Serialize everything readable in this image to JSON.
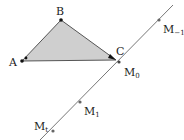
{
  "diagram": {
    "colors": {
      "triangle_fill": "#cfcfcf",
      "stroke": "#555555",
      "line": "#777777",
      "point": "#111111",
      "text": "#222222"
    },
    "triangle": {
      "vertices": [
        {
          "name": "A",
          "label": "A",
          "x": 22,
          "y": 61
        },
        {
          "name": "B",
          "label": "B",
          "x": 61,
          "y": 20
        },
        {
          "name": "C",
          "label": "C",
          "x": 116,
          "y": 60
        }
      ]
    },
    "line": {
      "x1": 40,
      "y1": 140,
      "x2": 173,
      "y2": 5
    },
    "line_points": [
      {
        "name": "M-1",
        "label": "M",
        "sub": "−1",
        "x": 159,
        "y": 20
      },
      {
        "name": "M0",
        "label": "M",
        "sub": "0",
        "x": 119,
        "y": 62
      },
      {
        "name": "M1",
        "label": "M",
        "sub": "1",
        "x": 80,
        "y": 102
      },
      {
        "name": "Mt",
        "label": "M",
        "sub": "t",
        "x": 53,
        "y": 131
      }
    ]
  }
}
